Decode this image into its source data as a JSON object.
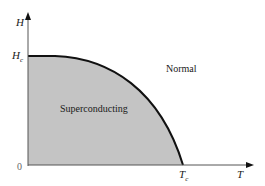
{
  "diagram": {
    "axes": {
      "y_label": "H",
      "x_label": "T",
      "origin_label": "0",
      "y_tick": {
        "main": "H",
        "sub": "c"
      },
      "x_tick": {
        "main": "T",
        "sub": "c"
      }
    },
    "regions": {
      "inside": "Superconducting",
      "outside": "Normal"
    },
    "colors": {
      "fill": "#c4c4c4",
      "curve": "#111111",
      "axis": "#555555",
      "background": "#ffffff"
    }
  }
}
